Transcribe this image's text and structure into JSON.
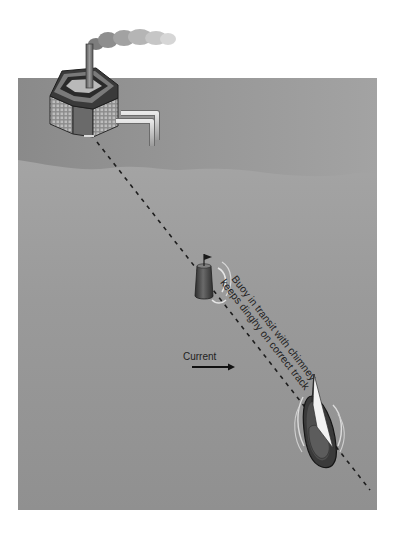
{
  "figure": {
    "current_label": "Current",
    "annotation_line1": "Buoy in transit with chimney",
    "annotation_line2": "keeps dinghy on correct track"
  },
  "elements": {
    "factory": "factory with chimney and smoke on shore",
    "buoy": "buoy with flag",
    "dinghy": "sailing dinghy",
    "transit_line": "dashed transit line from chimney through buoy to dinghy",
    "current_arrow": "arrow pointing right"
  },
  "colors": {
    "background": "#ffffff",
    "shore_water": "#8f8f8f",
    "open_water": "#979797",
    "dark": "#2a2a2a"
  }
}
